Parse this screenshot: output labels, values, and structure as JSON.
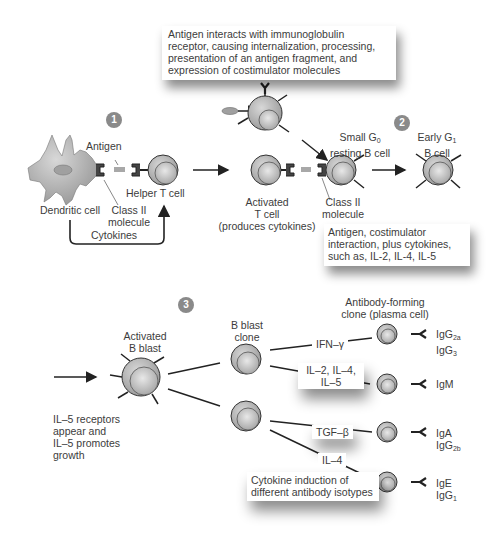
{
  "steps": [
    {
      "number": "1"
    },
    {
      "number": "2"
    },
    {
      "number": "3"
    }
  ],
  "panel1": {
    "antigen_label": "Antigen",
    "dendritic_cell_label": "Dendritic cell",
    "class2_line1": "Class II",
    "class2_line2": "molecule",
    "helper_t_label": "Helper T cell",
    "cytokines_label": "Cytokines"
  },
  "top_box": {
    "lines": [
      "Antigen interacts with immunoglobulin",
      "receptor, causing internalization, processing,",
      "presentation of an antigen fragment, and",
      "expression of costimulator molecules"
    ]
  },
  "panel2": {
    "activated_t_line1": "Activated",
    "activated_t_line2": "T cell",
    "activated_t_line3": "(produces cytokines)",
    "small_g0_line1": "Small G",
    "small_g0_sub": "0",
    "small_g0_line2": "resting B cell",
    "class2_line1": "Class II",
    "class2_line2": "molecule",
    "early_g1_line1": "Early G",
    "early_g1_sub": "1",
    "early_g1_line2": "B cell",
    "box_lines": [
      "Antigen, costimulator",
      "interaction, plus cytokines,",
      "such as, IL-2, IL-4, IL-5"
    ]
  },
  "panel3": {
    "activated_b_line1": "Activated",
    "activated_b_line2": "B blast",
    "il5_lines": [
      "IL–5 receptors",
      "appear and",
      "IL–5 promotes",
      "growth"
    ],
    "b_blast_clone_line1": "B blast",
    "b_blast_clone_line2": "clone",
    "afc_line1": "Antibody-forming",
    "afc_line2": "clone (plasma cell)",
    "cytokines": {
      "ifn": "IFN–γ",
      "il245_line1": "IL–2, IL–4,",
      "il245_line2": "IL–5",
      "tgf": "TGF–β",
      "il4": "IL–4"
    },
    "isotypes": [
      {
        "line1": "IgG",
        "sub1": "2a",
        "line2": "IgG",
        "sub2": "3"
      },
      {
        "line1": "IgM"
      },
      {
        "line1": "IgA",
        "line2": "IgG",
        "sub2": "2b"
      },
      {
        "line1": "IgE",
        "line2": "IgG",
        "sub2": "1"
      }
    ],
    "caption_line1": "Cytokine induction of",
    "caption_line2": "different antibody isotypes"
  },
  "colors": {
    "cell_outer": "#b8b8b8",
    "cell_inner": "#d4d4d4",
    "dendritic": "#9a9a9a",
    "line": "#222222",
    "step_badge": "#8a8a8a"
  }
}
